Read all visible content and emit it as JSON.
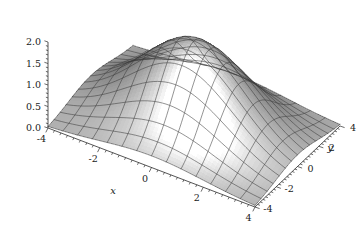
{
  "figure": {
    "kind": "3d-surface-plot",
    "style": "mathematica-plot3d-grayscale",
    "background_color": "#ffffff",
    "mesh_color": "#3a3a3a",
    "axis_color": "#2b2b2b"
  },
  "axes": {
    "x": {
      "title": "x",
      "ticks": [
        "-4",
        "-2",
        "0",
        "2",
        "4"
      ],
      "tick_values": [
        -4,
        -2,
        0,
        2,
        4
      ],
      "range": [
        -4,
        4
      ]
    },
    "y": {
      "title": "y",
      "ticks": [
        "-4",
        "-2",
        "0",
        "2",
        "4"
      ],
      "tick_values": [
        -4,
        -2,
        0,
        2,
        4
      ],
      "range": [
        -4,
        4
      ]
    },
    "z": {
      "title": "",
      "ticks": [
        "0.0",
        "0.5",
        "1.0",
        "1.5",
        "2.0"
      ],
      "tick_values": [
        0.0,
        0.5,
        1.0,
        1.5,
        2.0
      ],
      "range": [
        0,
        2
      ]
    }
  },
  "chart_data": {
    "type": "surface",
    "title": "",
    "xlabel": "x",
    "ylabel": "y",
    "zlabel": "",
    "xlim": [
      -4,
      4
    ],
    "ylim": [
      -4,
      4
    ],
    "zlim": [
      0,
      2
    ],
    "grid": true,
    "legend": "none",
    "colormap": "grayscale",
    "surface_formula": "z = 2*exp(-(x^2+y^2)/8)",
    "peak_value": 2.0,
    "peak_location": [
      0,
      0
    ],
    "mesh_divisions": 14,
    "x": [
      -4,
      -3.429,
      -2.857,
      -2.286,
      -1.714,
      -1.143,
      -0.571,
      0,
      0.571,
      1.143,
      1.714,
      2.286,
      2.857,
      3.429,
      4
    ],
    "y": [
      -4,
      -3.429,
      -2.857,
      -2.286,
      -1.714,
      -1.143,
      -0.571,
      0,
      0.571,
      1.143,
      1.714,
      2.286,
      2.857,
      3.429,
      4
    ],
    "z_grid": [
      [
        0.27,
        0.379,
        0.5,
        0.622,
        0.731,
        0.813,
        0.862,
        0.879,
        0.862,
        0.813,
        0.731,
        0.622,
        0.5,
        0.379,
        0.27
      ],
      [
        0.379,
        0.533,
        0.702,
        0.874,
        1.027,
        1.143,
        1.211,
        1.234,
        1.211,
        1.143,
        1.027,
        0.874,
        0.702,
        0.533,
        0.379
      ],
      [
        0.5,
        0.702,
        0.925,
        1.151,
        1.353,
        1.505,
        1.595,
        1.626,
        1.595,
        1.505,
        1.353,
        1.151,
        0.925,
        0.702,
        0.5
      ],
      [
        0.622,
        0.874,
        1.151,
        1.432,
        1.683,
        1.872,
        1.984,
        2.0,
        1.984,
        1.872,
        1.683,
        1.432,
        1.151,
        0.874,
        0.622
      ],
      [
        0.731,
        1.027,
        1.353,
        1.683,
        1.978,
        2.0,
        2.0,
        2.0,
        2.0,
        2.0,
        1.978,
        1.683,
        1.353,
        1.027,
        0.731
      ],
      [
        0.813,
        1.143,
        1.505,
        1.872,
        2.0,
        2.0,
        2.0,
        2.0,
        2.0,
        2.0,
        2.0,
        1.872,
        1.505,
        1.143,
        0.813
      ],
      [
        0.862,
        1.211,
        1.595,
        1.984,
        2.0,
        2.0,
        2.0,
        2.0,
        2.0,
        2.0,
        2.0,
        1.984,
        1.595,
        1.211,
        0.862
      ],
      [
        0.879,
        1.234,
        1.626,
        2.0,
        2.0,
        2.0,
        2.0,
        2.0,
        2.0,
        2.0,
        2.0,
        2.0,
        1.626,
        1.234,
        0.879
      ],
      [
        0.862,
        1.211,
        1.595,
        1.984,
        2.0,
        2.0,
        2.0,
        2.0,
        2.0,
        2.0,
        2.0,
        1.984,
        1.595,
        1.211,
        0.862
      ],
      [
        0.813,
        1.143,
        1.505,
        1.872,
        2.0,
        2.0,
        2.0,
        2.0,
        2.0,
        2.0,
        2.0,
        1.872,
        1.505,
        1.143,
        0.813
      ],
      [
        0.731,
        1.027,
        1.353,
        1.683,
        1.978,
        2.0,
        2.0,
        2.0,
        2.0,
        2.0,
        1.978,
        1.683,
        1.353,
        1.027,
        0.731
      ],
      [
        0.622,
        0.874,
        1.151,
        1.432,
        1.683,
        1.872,
        1.984,
        2.0,
        1.984,
        1.872,
        1.683,
        1.432,
        1.151,
        0.874,
        0.622
      ],
      [
        0.5,
        0.702,
        0.925,
        1.151,
        1.353,
        1.505,
        1.595,
        1.626,
        1.595,
        1.505,
        1.353,
        1.151,
        0.925,
        0.702,
        0.5
      ],
      [
        0.379,
        0.533,
        0.702,
        0.874,
        1.027,
        1.143,
        1.211,
        1.234,
        1.211,
        1.143,
        1.027,
        0.874,
        0.702,
        0.533,
        0.379
      ],
      [
        0.27,
        0.379,
        0.5,
        0.622,
        0.731,
        0.813,
        0.862,
        0.879,
        0.862,
        0.813,
        0.731,
        0.622,
        0.5,
        0.379,
        0.27
      ]
    ]
  }
}
